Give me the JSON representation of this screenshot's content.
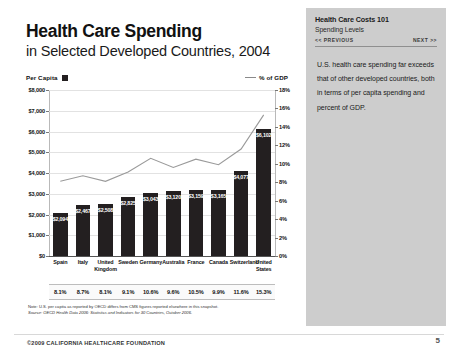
{
  "slide": {
    "title_main": "Health Care Spending",
    "title_sub": "in Selected Developed Countries, 2004",
    "legend_per_capita": "Per Capita",
    "legend_pct_gdp": "% of GDP",
    "note": "Note: U.S. per capita as reported by OECD differs from CMS figures reported elsewhere in this snapshot.",
    "source": "Source: OECD Health Data 2006: Statistics and Indicators for 30 Countries, October 2006.",
    "footer_credit": "©2009 CALIFORNIA HEALTHCARE FOUNDATION",
    "page_number": "5"
  },
  "sidebar": {
    "title": "Health Care Costs 101",
    "subtitle": "Spending Levels",
    "prev_label": "<< PREVIOUS",
    "next_label": "NEXT >>",
    "body": "U.S. health care spending far exceeds that of other developed countries, both in terms of per capita spending and percent of GDP."
  },
  "chart_data": {
    "type": "bar",
    "title": "Health Care Spending in Selected Developed Countries, 2004",
    "xlabel": "",
    "ylabel": "Per Capita",
    "y2label": "% of GDP",
    "ylim": [
      0,
      8000
    ],
    "y2lim": [
      0,
      18
    ],
    "grid": true,
    "legend_position": "top",
    "categories": [
      "Spain",
      "Italy",
      "United Kingdom",
      "Sweden",
      "Germany",
      "Australia",
      "France",
      "Canada",
      "Switzerland",
      "United States"
    ],
    "yticks": [
      "$0",
      "$1,000",
      "$2,000",
      "$3,000",
      "$4,000",
      "$5,000",
      "$6,000",
      "$7,000",
      "$8,000"
    ],
    "y2ticks": [
      "0%",
      "2%",
      "4%",
      "6%",
      "8%",
      "10%",
      "12%",
      "14%",
      "16%",
      "18%"
    ],
    "series": [
      {
        "name": "Per Capita",
        "type": "bar",
        "values": [
          2094,
          2467,
          2508,
          2825,
          3043,
          3120,
          3159,
          3165,
          4077,
          6102
        ],
        "labels": [
          "$2,094",
          "$2,467",
          "$2,508",
          "$2,825",
          "$3,043",
          "$3,120",
          "$3,159",
          "$3,165",
          "$4,077",
          "$6,102"
        ]
      },
      {
        "name": "% of GDP",
        "type": "line",
        "values": [
          8.1,
          8.7,
          8.1,
          9.1,
          10.6,
          9.6,
          10.5,
          9.9,
          11.6,
          15.3
        ],
        "labels": [
          "8.1%",
          "8.7%",
          "8.1%",
          "9.1%",
          "10.6%",
          "9.6%",
          "10.5%",
          "9.9%",
          "11.6%",
          "15.3%"
        ]
      }
    ]
  }
}
